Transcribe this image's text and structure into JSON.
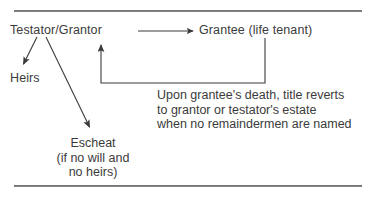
{
  "diagram": {
    "title_rules": {
      "top_rule": "horizontal-rule",
      "bottom_rule": "horizontal-rule"
    },
    "nodes": {
      "testator": "Testator/Grantor",
      "grantee": "Grantee (life tenant)",
      "heirs": "Heirs",
      "escheat_line1": "Escheat",
      "escheat_line2": "(if no will and",
      "escheat_line3": "no heirs)"
    },
    "note": {
      "line1": "Upon grantee's death, title reverts",
      "line2": "to grantor or testator's estate",
      "line3": "when no remaindermen are named"
    },
    "arrows": [
      {
        "name": "testator-to-grantee",
        "type": "straight-horizontal",
        "from": [
          138,
          31
        ],
        "to": [
          196,
          31
        ]
      },
      {
        "name": "testator-to-heirs",
        "type": "straight-diagonal",
        "from": [
          37,
          37
        ],
        "to": [
          22,
          67
        ]
      },
      {
        "name": "testator-to-escheat",
        "type": "straight-diagonal",
        "from": [
          46,
          37
        ],
        "to": [
          92,
          132
        ]
      },
      {
        "name": "grantee-reverts-to-grantor",
        "type": "elbow-loop",
        "path": [
          [
            265,
            38
          ],
          [
            265,
            83
          ],
          [
            101,
            83
          ],
          [
            101,
            41
          ]
        ]
      }
    ],
    "colors": {
      "text": "#3b3b3b",
      "line": "#3b3b3b",
      "rule": "#5c5c5c",
      "background": "#ffffff"
    }
  }
}
